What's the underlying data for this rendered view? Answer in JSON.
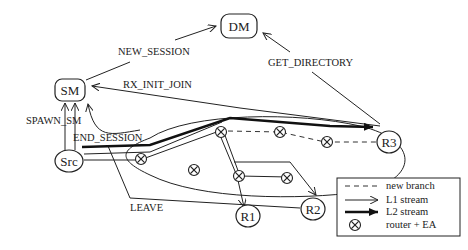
{
  "diagram": {
    "nodes": {
      "dm": {
        "label": "DM"
      },
      "sm": {
        "label": "SM"
      },
      "src": {
        "label": "Src"
      },
      "r1": {
        "label": "R1"
      },
      "r2": {
        "label": "R2"
      },
      "r3": {
        "label": "R3"
      }
    },
    "messages": {
      "new_session": "NEW_SESSION",
      "get_directory": "GET_DIRECTORY",
      "rx_init_join": "RX_INIT_JOIN",
      "spawn_sm": "SPAWN_SM",
      "end_session": "END_SESSION",
      "leave": "LEAVE"
    },
    "legend": {
      "items": [
        {
          "symbol": "dashed-line",
          "label": "new branch"
        },
        {
          "symbol": "thin-arrow",
          "label": "L1 stream"
        },
        {
          "symbol": "thick-arrow",
          "label": "L2 stream"
        },
        {
          "symbol": "router-ea",
          "label": "router + EA"
        }
      ]
    }
  }
}
